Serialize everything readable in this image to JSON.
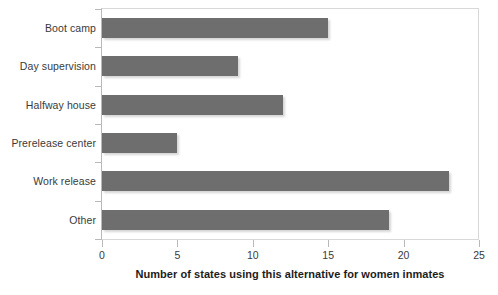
{
  "chart_data": {
    "type": "bar",
    "orientation": "horizontal",
    "title": "",
    "subtitle": "",
    "categories": [
      "Boot camp",
      "Day supervision",
      "Halfway house",
      "Prerelease center",
      "Work release",
      "Other"
    ],
    "values": [
      15,
      9,
      12,
      5,
      23,
      19
    ],
    "xlabel": "Number of states using this alternative for women inmates",
    "ylabel": "",
    "xlim": [
      0,
      25
    ],
    "x_ticks": [
      0,
      5,
      10,
      15,
      20,
      25
    ],
    "x_tick_labels": [
      "0",
      "5",
      "10",
      "15",
      "20",
      "25"
    ],
    "grid": false,
    "legend": false,
    "bar_color": "#6e6e6e",
    "plot_border_color": "#d8d8d8",
    "axis_color": "#b9b9b9",
    "text_color": "#3a3a3a"
  }
}
